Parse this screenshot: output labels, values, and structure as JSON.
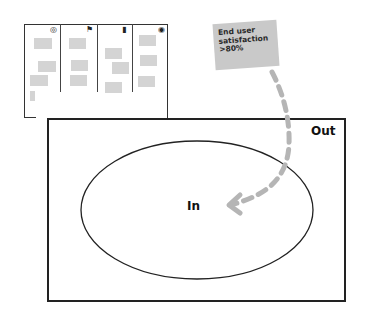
{
  "board": {
    "columns": [
      {
        "icon": "target-icon",
        "glyph": "◎"
      },
      {
        "icon": "flag-icon",
        "glyph": "⚑"
      },
      {
        "icon": "battery-icon",
        "glyph": "▮"
      },
      {
        "icon": "eye-icon",
        "glyph": "◉"
      }
    ]
  },
  "sticky_note": {
    "lines": [
      "End user",
      "satisfaction",
      ">80%"
    ],
    "color": "#c9c9c9"
  },
  "scope": {
    "out_label": "Out",
    "in_label": "In"
  },
  "colors": {
    "arrow": "#b5b5b5",
    "card": "#d4d4d4",
    "stroke": "#222222"
  }
}
